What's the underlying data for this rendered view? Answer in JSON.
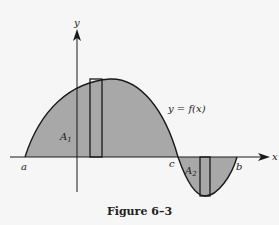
{
  "figure": {
    "caption": "Figure 6–3",
    "function_label": "y = f(x)",
    "axes": {
      "x_label": "x",
      "y_label": "y"
    },
    "points": {
      "a": "a",
      "c": "c",
      "b": "b"
    },
    "regions": [
      {
        "name": "A1",
        "label_main": "A",
        "label_sub": "1",
        "sign": "positive",
        "fill": "#a8a8a8"
      },
      {
        "name": "A2",
        "label_main": "A",
        "label_sub": "2",
        "sign": "negative",
        "fill": "#a8a8a8"
      }
    ],
    "colors": {
      "fill": "#a8a8a8",
      "stroke": "#1a1a1a",
      "background": "#f6f6f6"
    }
  }
}
